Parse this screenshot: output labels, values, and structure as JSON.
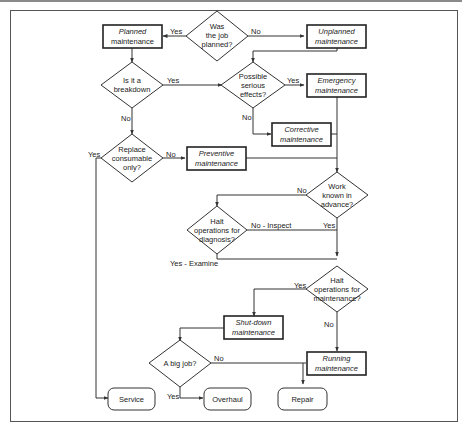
{
  "diagram": {
    "type": "flowchart",
    "nodes": {
      "was_planned": {
        "kind": "decision",
        "lines": [
          "Was",
          "the job",
          "planned?"
        ]
      },
      "planned": {
        "kind": "process",
        "lines": [
          "Planned",
          "maintenance"
        ]
      },
      "unplanned": {
        "kind": "process",
        "lines": [
          "Unplanned",
          "maintenance"
        ]
      },
      "breakdown": {
        "kind": "decision",
        "lines": [
          "Is it a",
          "breakdown"
        ]
      },
      "serious": {
        "kind": "decision",
        "lines": [
          "Possible",
          "serious",
          "effects?"
        ]
      },
      "emergency": {
        "kind": "process",
        "lines": [
          "Emergency",
          "maintenance"
        ]
      },
      "corrective": {
        "kind": "process",
        "lines": [
          "Corrective",
          "maintenance"
        ]
      },
      "replace": {
        "kind": "decision",
        "lines": [
          "Replace",
          "consumable",
          "only?"
        ]
      },
      "preventive": {
        "kind": "process",
        "lines": [
          "Preventive",
          "maintenance"
        ]
      },
      "work_known": {
        "kind": "decision",
        "lines": [
          "Work",
          "known in",
          "advance?"
        ]
      },
      "halt_diag": {
        "kind": "decision",
        "lines": [
          "Halt",
          "operations for",
          "diagnosis?"
        ]
      },
      "halt_maint": {
        "kind": "decision",
        "lines": [
          "Halt",
          "operations for",
          "maintenance?"
        ]
      },
      "shutdown": {
        "kind": "process",
        "lines": [
          "Shut-down",
          "maintenance"
        ]
      },
      "big_job": {
        "kind": "decision",
        "lines": [
          "A big job?"
        ]
      },
      "running": {
        "kind": "process",
        "lines": [
          "Running",
          "maintenance"
        ]
      },
      "service": {
        "kind": "terminal",
        "lines": [
          "Service"
        ]
      },
      "overhaul": {
        "kind": "terminal",
        "lines": [
          "Overhaul"
        ]
      },
      "repair": {
        "kind": "terminal",
        "lines": [
          "Repair"
        ]
      }
    },
    "edge_labels": {
      "was_planned_yes": "Yes",
      "was_planned_no": "No",
      "breakdown_yes": "Yes",
      "breakdown_no": "No",
      "serious_yes": "Yes",
      "serious_no": "No",
      "replace_yes": "Yes",
      "replace_no": "No",
      "work_known_no": "No",
      "work_known_yes": "Yes",
      "halt_diag_no": "No - Inspect",
      "halt_diag_yes": "Yes - Examine",
      "halt_maint_yes": "Yes",
      "halt_maint_no": "No",
      "big_job_no": "No",
      "big_job_yes": "Yes"
    }
  }
}
